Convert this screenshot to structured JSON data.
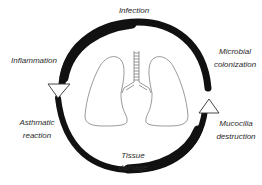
{
  "diagram": {
    "type": "cycle",
    "center_graphic": "lungs-with-trachea",
    "colors": {
      "ring": "#111111",
      "arrowhead_fill": "#ffffff",
      "arrowhead_stroke": "#333333",
      "lung_stroke": "#555555",
      "text": "#2a2a2a",
      "background": "#ffffff"
    },
    "labels": {
      "infection": "Infection",
      "microbial_line1": "Microbial",
      "microbial_line2": "colonization",
      "mucocilia_line1": "Mucocilia",
      "mucocilia_line2": "destruction",
      "tissue_line1": "Tissue",
      "tissue_line2": "damage",
      "asthmatic_line1": "Asthmatic",
      "asthmatic_line2": "reaction",
      "inflammation": "Inflammation"
    },
    "cycle_order": [
      "Infection",
      "Microbial colonization",
      "Mucocilia destruction",
      "Tissue damage",
      "Asthmatic reaction",
      "Inflammation"
    ],
    "arrows": [
      {
        "position": "left",
        "direction": "down"
      },
      {
        "position": "right",
        "direction": "up"
      }
    ]
  }
}
